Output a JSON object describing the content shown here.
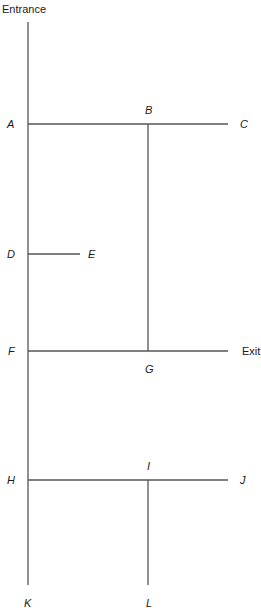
{
  "diagram": {
    "markers": {
      "entrance": "Entrance",
      "exit": "Exit"
    },
    "points": {
      "A": "A",
      "B": "B",
      "C": "C",
      "D": "D",
      "E": "E",
      "F": "F",
      "G": "G",
      "H": "H",
      "I": "I",
      "J": "J",
      "K": "K",
      "L": "L"
    },
    "edges": [
      {
        "from": "Entrance",
        "to": "K",
        "type": "main-corridor"
      },
      {
        "from": "A",
        "to": "C",
        "via": "B"
      },
      {
        "from": "D",
        "to": "E"
      },
      {
        "from": "F",
        "to": "Exit",
        "via": "G"
      },
      {
        "from": "H",
        "to": "J",
        "via": "I"
      },
      {
        "from": "B",
        "to": "G"
      },
      {
        "from": "I",
        "to": "L"
      }
    ],
    "line_color": "#555555"
  }
}
